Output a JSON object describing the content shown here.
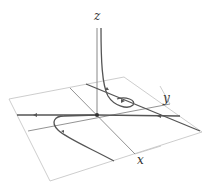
{
  "diagram": {
    "type": "3d phase portrait",
    "axes": {
      "x": {
        "label": "x"
      },
      "y": {
        "label": "y"
      },
      "z": {
        "label": "z"
      }
    },
    "colors": {
      "plane": "#b8b8b8",
      "curve": "#555555",
      "axis": "#666666",
      "background": "#ffffff"
    }
  }
}
